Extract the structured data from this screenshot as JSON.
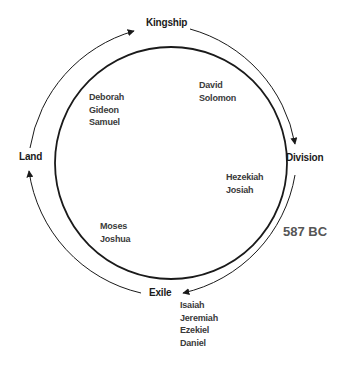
{
  "stages": {
    "kingship": "Kingship",
    "division": "Division",
    "exile": "Exile",
    "land": "Land"
  },
  "figures": {
    "judges": [
      "Deborah",
      "Gideon",
      "Samuel"
    ],
    "kings": [
      "David",
      "Solomon"
    ],
    "reformers": [
      "Hezekiah",
      "Josiah"
    ],
    "founders": [
      "Moses",
      "Joshua"
    ],
    "prophets": [
      "Isaiah",
      "Jeremiah",
      "Ezekiel",
      "Daniel"
    ]
  },
  "annotation": {
    "date": "587 BC"
  },
  "colors": {
    "line": "#1a1a1a",
    "text": "#1a1a1a",
    "names": "#3a3a3a",
    "date": "#555555"
  }
}
